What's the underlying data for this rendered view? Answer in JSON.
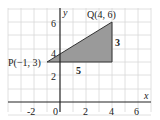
{
  "diagram": {
    "type": "coordinate-geometry",
    "axes": {
      "x_label": "x",
      "y_label": "y",
      "x_ticks": [
        "-2",
        "0",
        "2",
        "4",
        "6"
      ],
      "y_ticks": [
        "2",
        "4",
        "6"
      ],
      "xlim": [
        -3,
        7
      ],
      "ylim": [
        -1,
        7
      ],
      "grid": true
    },
    "points": {
      "P": {
        "label": "P(−1, 3)",
        "x": -1,
        "y": 3
      },
      "Q": {
        "label": "Q(4, 6)",
        "x": 4,
        "y": 6
      }
    },
    "triangle": {
      "vertices": [
        [
          -1,
          3
        ],
        [
          4,
          6
        ],
        [
          4,
          3
        ]
      ],
      "fill": "#9a9a9a",
      "horizontal_leg_label": "5",
      "vertical_leg_label": "3"
    },
    "colors": {
      "grid": "#d8d8d8",
      "axis": "#222222",
      "triangle_fill": "#9a9a9a",
      "triangle_stroke": "#333333"
    }
  }
}
